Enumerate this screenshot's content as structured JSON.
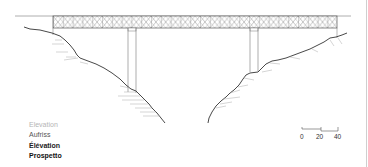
{
  "diagram": {
    "type": "bridge-elevation-drawing",
    "view_labels": [
      {
        "text": "Elevation",
        "language": "en"
      },
      {
        "text": "Aufriss",
        "language": "de"
      },
      {
        "text": "Élévation",
        "language": "fr"
      },
      {
        "text": "Prospetto",
        "language": "it"
      }
    ],
    "scale_bar": {
      "ticks": [
        "0",
        "20",
        "40"
      ]
    },
    "colors": {
      "line": "#333333",
      "hatch": "#9a9a9a",
      "label_faded": "#b5b5b5"
    }
  }
}
